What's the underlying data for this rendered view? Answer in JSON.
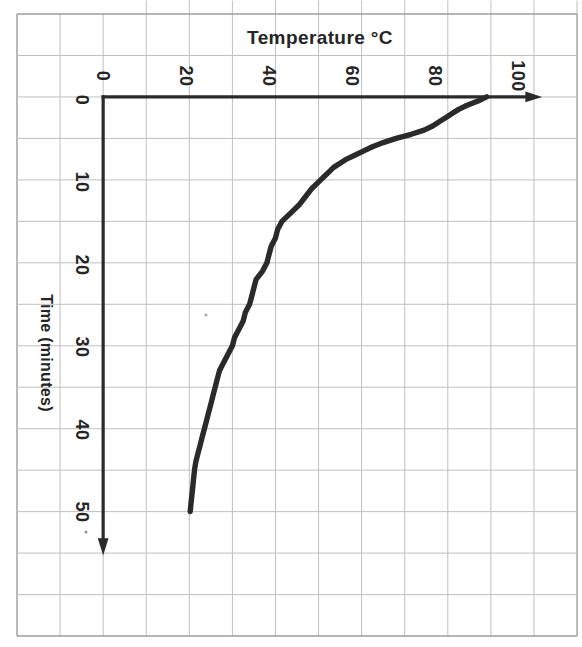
{
  "chart_data": {
    "type": "line",
    "title": "Temperature °C",
    "orientation": "rotated 90°: temperature increases left-to-right on the horizontal axis, time increases top-to-bottom on the vertical axis; all text glyphs rotated 90° clockwise",
    "temperature_axis": {
      "label": "Temperature °C",
      "min": 0,
      "max": 100,
      "tick_labels": [
        "0",
        "20",
        "40",
        "60",
        "80",
        "100"
      ],
      "gridline_step": 10,
      "arrow_direction": "right"
    },
    "time_axis": {
      "label": "Time (minutes)",
      "min": 0,
      "max": 50,
      "tick_labels": [
        "0",
        "10",
        "20",
        "30",
        "40",
        "50"
      ],
      "gridline_step": 5,
      "arrow_direction": "down"
    },
    "grid": "on",
    "legend": "none",
    "series": [
      {
        "name": "cooling curve",
        "points_time_min_temp_c": [
          [
            0,
            89
          ],
          [
            0.5,
            87
          ],
          [
            1,
            84.5
          ],
          [
            1.5,
            82.5
          ],
          [
            2,
            81
          ],
          [
            2.5,
            79.5
          ],
          [
            3,
            78
          ],
          [
            3.5,
            76.5
          ],
          [
            4,
            74.5
          ],
          [
            4.5,
            71.5
          ],
          [
            5,
            68
          ],
          [
            5.5,
            65
          ],
          [
            6,
            62.5
          ],
          [
            6.5,
            60.5
          ],
          [
            7,
            58.5
          ],
          [
            7.5,
            56.5
          ],
          [
            8,
            55
          ],
          [
            8.5,
            53.5
          ],
          [
            9,
            52.5
          ],
          [
            9.5,
            51.5
          ],
          [
            10,
            50.5
          ],
          [
            11,
            48.5
          ],
          [
            12,
            47
          ],
          [
            13,
            45.5
          ],
          [
            14,
            43.5
          ],
          [
            15,
            41.5
          ],
          [
            16,
            40.5
          ],
          [
            17,
            40
          ],
          [
            18,
            39
          ],
          [
            19,
            38.5
          ],
          [
            20,
            38
          ],
          [
            21,
            37
          ],
          [
            22,
            35.5
          ],
          [
            23,
            35
          ],
          [
            24,
            34.5
          ],
          [
            25,
            34
          ],
          [
            26,
            33
          ],
          [
            27,
            32.5
          ],
          [
            28,
            31.5
          ],
          [
            29,
            30.5
          ],
          [
            30,
            30
          ],
          [
            31,
            29
          ],
          [
            32,
            28
          ],
          [
            33,
            27
          ],
          [
            34,
            26.5
          ],
          [
            35,
            26
          ],
          [
            36,
            25.5
          ],
          [
            37,
            25
          ],
          [
            38,
            24.5
          ],
          [
            39,
            24
          ],
          [
            40,
            23.5
          ],
          [
            41,
            23
          ],
          [
            42,
            22.5
          ],
          [
            43,
            22
          ],
          [
            44,
            21.5
          ],
          [
            45,
            21.2
          ],
          [
            46,
            21
          ],
          [
            47,
            20.8
          ],
          [
            48,
            20.6
          ],
          [
            49,
            20.4
          ],
          [
            50,
            20.2
          ]
        ]
      }
    ]
  },
  "colors": {
    "ink": "#252525",
    "curve": "#2a2a2a",
    "axis": "#2a2a2a",
    "grid": "#bfbfbf",
    "border": "#9c9c9c",
    "background": "#ffffff"
  }
}
